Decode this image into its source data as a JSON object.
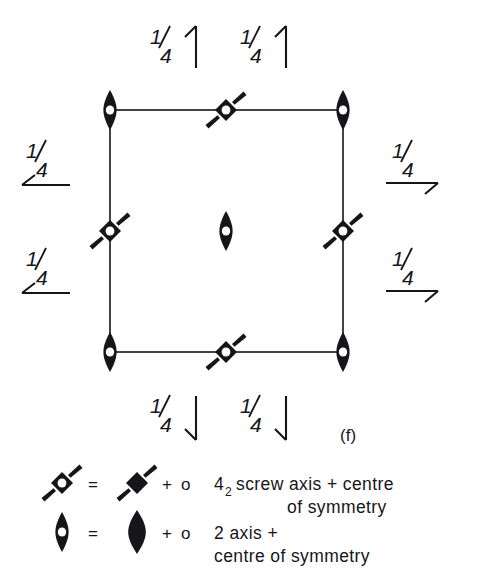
{
  "figure": {
    "label": "(f)",
    "kind": "space-group-symmetry-diagram"
  },
  "cell": {
    "left": 110,
    "top": 110,
    "right": 343,
    "bottom": 352
  },
  "fraction_labels": {
    "top_left": {
      "text": "1/4",
      "numerator": "1",
      "denominator": "4",
      "arrow": "up",
      "x": 168,
      "y": 52
    },
    "top_right": {
      "text": "1/4",
      "numerator": "1",
      "denominator": "4",
      "arrow": "up",
      "x": 258,
      "y": 52
    },
    "left_upper": {
      "text": "1/4",
      "numerator": "1",
      "denominator": "4",
      "arrow": "left",
      "x": 38,
      "y": 160
    },
    "left_lower": {
      "text": "1/4",
      "numerator": "1",
      "denominator": "4",
      "arrow": "left",
      "x": 38,
      "y": 268
    },
    "right_upper": {
      "text": "1/4",
      "numerator": "1",
      "denominator": "4",
      "arrow": "right",
      "x": 404,
      "y": 160
    },
    "right_lower": {
      "text": "1/4",
      "numerator": "1",
      "denominator": "4",
      "arrow": "right",
      "x": 404,
      "y": 268
    },
    "bottom_left": {
      "text": "1/4",
      "numerator": "1",
      "denominator": "4",
      "arrow": "down",
      "x": 168,
      "y": 415
    },
    "bottom_right": {
      "text": "1/4",
      "numerator": "1",
      "denominator": "4",
      "arrow": "down",
      "x": 258,
      "y": 415
    }
  },
  "symmetry_elements": [
    {
      "id": "corner-top-left",
      "symbol": "two-fold-axis-with-centre",
      "x": 110,
      "y": 110
    },
    {
      "id": "edge-top-mid",
      "symbol": "four-two-screw-with-centre",
      "x": 226,
      "y": 110
    },
    {
      "id": "corner-top-right",
      "symbol": "two-fold-axis-with-centre",
      "x": 343,
      "y": 110
    },
    {
      "id": "edge-left-mid",
      "symbol": "four-two-screw-with-centre",
      "x": 110,
      "y": 231
    },
    {
      "id": "cell-centre",
      "symbol": "two-fold-axis-with-centre",
      "x": 226,
      "y": 231
    },
    {
      "id": "edge-right-mid",
      "symbol": "four-two-screw-with-centre",
      "x": 343,
      "y": 231
    },
    {
      "id": "corner-bottom-left",
      "symbol": "two-fold-axis-with-centre",
      "x": 110,
      "y": 352
    },
    {
      "id": "edge-bottom-mid",
      "symbol": "four-two-screw-with-centre",
      "x": 226,
      "y": 352
    },
    {
      "id": "corner-bottom-right",
      "symbol": "two-fold-axis-with-centre",
      "x": 343,
      "y": 352
    }
  ],
  "legend": {
    "rows": [
      {
        "id": "legend-row-screw",
        "combined_symbol": "four-two-screw-with-centre",
        "equals": "=",
        "base_symbol": "four-two-screw-axis",
        "plus": "+",
        "centre_symbol": "o",
        "label_main": "screw axis + centre",
        "label_prefix": "4",
        "label_subscript": "2",
        "label_second_line": "of  symmetry"
      },
      {
        "id": "legend-row-two-fold",
        "combined_symbol": "two-fold-axis-with-centre",
        "equals": "=",
        "base_symbol": "two-fold-axis",
        "plus": "+",
        "centre_symbol": "o",
        "label_main": "2 axis +",
        "label_prefix": "",
        "label_subscript": "",
        "label_second_line": "centre  of  symmetry"
      }
    ]
  },
  "colors": {
    "ink": "#16161a",
    "paper": "#ffffff",
    "hole": "#ffffff"
  }
}
